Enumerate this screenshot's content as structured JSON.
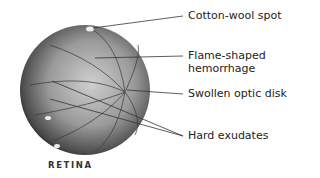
{
  "diagram": {
    "subject": "Retina",
    "caption": "RETINA",
    "labels": [
      {
        "id": "cotton-wool-spot",
        "text": "Cotton-wool spot"
      },
      {
        "id": "flame-shaped-hemorrhage",
        "line1": "Flame-shaped",
        "line2": "hemorrhage"
      },
      {
        "id": "swollen-optic-disk",
        "text": "Swollen optic disk"
      },
      {
        "id": "hard-exudates",
        "text": "Hard exudates"
      }
    ]
  }
}
